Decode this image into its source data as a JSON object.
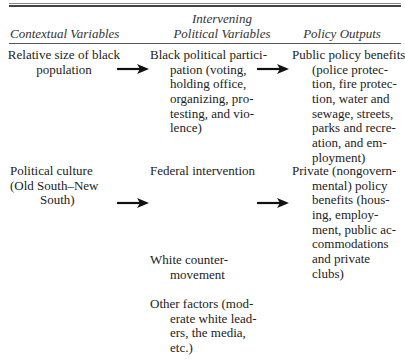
{
  "table": {
    "header": {
      "col1": "Contextual Variables",
      "col2_line1": "Intervening",
      "col2_line2": "Political Variables",
      "col3": "Policy Outputs"
    },
    "contextual_variables": [
      {
        "lines": [
          "Relative size of black",
          "population"
        ]
      },
      {
        "lines": [
          "Political culture",
          "(Old South–New",
          "South)"
        ]
      }
    ],
    "intervening_variables": [
      {
        "lines": [
          "Black political partici-",
          "pation (voting,",
          "holding office,",
          "organizing, pro-",
          "testing, and vio-",
          "lence)"
        ]
      },
      {
        "lines": [
          "Federal intervention"
        ]
      },
      {
        "lines": [
          "White counter-",
          "movement"
        ]
      },
      {
        "lines": [
          "Other factors (mod-",
          "erate white lead-",
          "ers, the media,",
          "etc.)"
        ]
      }
    ],
    "policy_outputs": [
      {
        "lines": [
          "Public policy benefits",
          "(police protec-",
          "tion, fire protec-",
          "tion, water and",
          "sewage, streets,",
          "parks and recre-",
          "ation, and em-",
          "ployment)"
        ]
      },
      {
        "lines": [
          "Private (nongovern-",
          "mental) policy",
          "benefits (hous-",
          "ing, employ-",
          "ment, public ac-",
          "commodations",
          "and private",
          "clubs)"
        ]
      }
    ],
    "arrows": [
      "right-arrow",
      "right-arrow",
      "right-arrow",
      "right-arrow"
    ]
  }
}
